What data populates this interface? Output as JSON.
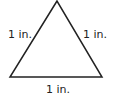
{
  "diagram": {
    "shape": "equilateral triangle",
    "stroke_color": "#222222",
    "labels": {
      "left_side": "1 in.",
      "right_side": "1 in.",
      "base": "1 in."
    }
  }
}
